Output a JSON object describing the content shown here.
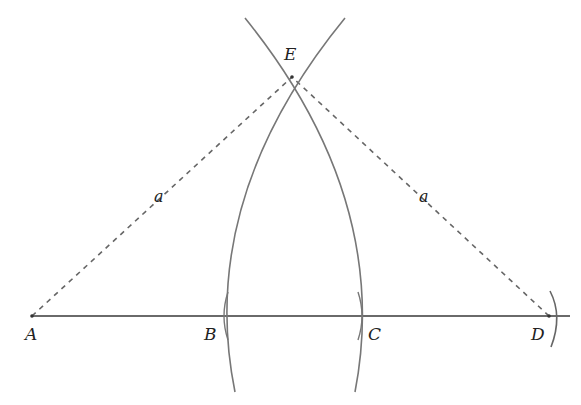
{
  "diagram": {
    "type": "geometric-construction",
    "points": {
      "A": {
        "label": "A",
        "x": 32,
        "y": 316
      },
      "B": {
        "label": "B",
        "x": 224,
        "y": 316
      },
      "C": {
        "label": "C",
        "x": 362,
        "y": 316
      },
      "D": {
        "label": "D",
        "x": 549,
        "y": 316
      },
      "E": {
        "label": "E",
        "x": 292,
        "y": 77
      }
    },
    "segment_labels": {
      "AE": "a",
      "DE": "a"
    },
    "colors": {
      "line": "#666666",
      "text": "#222222",
      "background": "#ffffff"
    }
  }
}
